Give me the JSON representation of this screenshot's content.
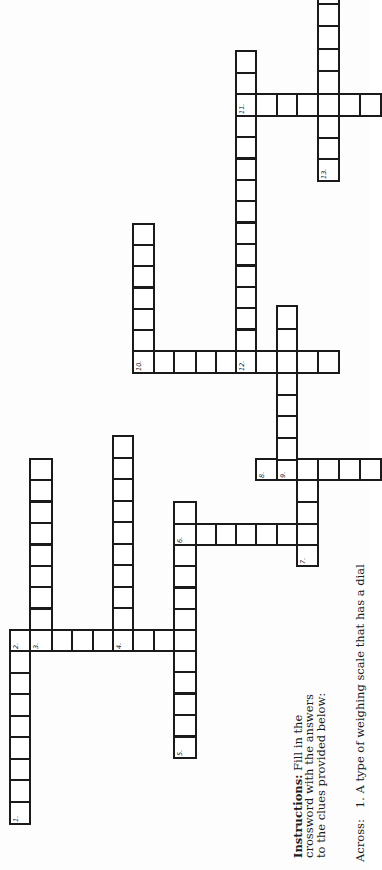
{
  "instructions": {
    "label": "Instructions:",
    "lines": [
      "Fill in the",
      "crossword with the answers",
      "to the clues provided below:"
    ]
  },
  "clues": {
    "across_label": "Across:",
    "across": [
      {
        "number": "1.",
        "text": "A type of weighing scale that has a dial"
      }
    ]
  },
  "grid": {
    "numbers": [
      "1.",
      "2.",
      "3.",
      "4.",
      "5.",
      "6.",
      "7.",
      "8.",
      "9.",
      "10.",
      "11.",
      "12.",
      "13."
    ],
    "words": [
      {
        "number": "1.",
        "direction": "across",
        "length": 9
      },
      {
        "number": "2.",
        "direction": "down",
        "length": 9
      },
      {
        "number": "3.",
        "direction": "across",
        "length": 9
      },
      {
        "number": "4.",
        "direction": "across",
        "length": 10
      },
      {
        "number": "5.",
        "direction": "across",
        "length": 12
      },
      {
        "number": "6.",
        "direction": "down",
        "length": 8
      },
      {
        "number": "7.",
        "direction": "across",
        "length": 5
      },
      {
        "number": "8.",
        "direction": "down",
        "length": 6
      },
      {
        "number": "9.",
        "direction": "across",
        "length": 9
      },
      {
        "number": "10.",
        "direction": "down",
        "length": 10
      },
      {
        "number": "11.",
        "direction": "down",
        "length": 7
      },
      {
        "number": "12.",
        "direction": "across",
        "length": 16
      },
      {
        "number": "13.",
        "direction": "across",
        "length": 9
      }
    ]
  },
  "colors": {
    "grid_line": "#1a1a1a",
    "paper": "#fdfdfd",
    "text": "#1b1b1b"
  }
}
